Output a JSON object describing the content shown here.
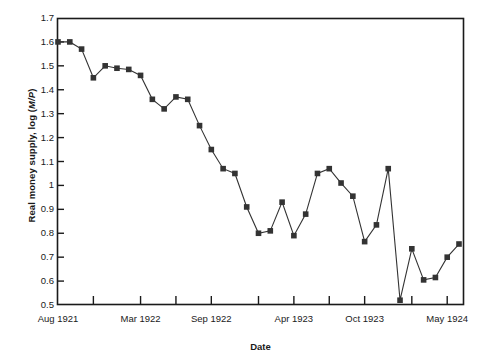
{
  "chart_data": {
    "type": "line",
    "title": "",
    "xlabel": "Date",
    "ylabel": "Real money supply, log (M/P)",
    "ylabel_plain": "Real money supply, log (",
    "ylabel_italic": "M/P",
    "ylabel_tail": ")",
    "ylim": [
      0.5,
      1.7
    ],
    "yticks": [
      0.5,
      0.6,
      0.7,
      0.8,
      0.9,
      1.0,
      1.1,
      1.2,
      1.3,
      1.4,
      1.5,
      1.6,
      1.7
    ],
    "ytick_labels": [
      "0.5",
      "0.6",
      "0.7",
      "0.8",
      "0.9",
      "1",
      "1.1",
      "1.2",
      "1.3",
      "1.4",
      "1.5",
      "1.6",
      "1.7"
    ],
    "xtick_labels": [
      "Aug 1921",
      "Mar 1922",
      "Sep 1922",
      "Apr 1923",
      "Oct 1923",
      "May 1924"
    ],
    "xtick_indices": [
      0,
      7,
      13,
      20,
      26,
      33
    ],
    "minor_xtick_indices": [
      3,
      10,
      17,
      23,
      30
    ],
    "grid": false,
    "legend": false,
    "marker": "square",
    "marker_color": "#333333",
    "line_color": "#333333",
    "x": [
      "Aug 1921",
      "Sep 1921",
      "Oct 1921",
      "Nov 1921",
      "Dec 1921",
      "Jan 1922",
      "Feb 1922",
      "Mar 1922",
      "Apr 1922",
      "May 1922",
      "Jun 1922",
      "Jul 1922",
      "Aug 1922",
      "Sep 1922",
      "Oct 1922",
      "Nov 1922",
      "Dec 1922",
      "Jan 1923",
      "Feb 1923",
      "Mar 1923",
      "Apr 1923",
      "May 1923",
      "Jun 1923",
      "Jul 1923",
      "Aug 1923",
      "Sep 1923",
      "Oct 1923",
      "Nov 1923",
      "Dec 1923",
      "Jan 1924",
      "Feb 1924",
      "Mar 1924",
      "Apr 1924",
      "May 1924",
      "Jun 1924"
    ],
    "values": [
      1.6,
      1.6,
      1.57,
      1.45,
      1.5,
      1.49,
      1.485,
      1.46,
      1.36,
      1.32,
      1.37,
      1.36,
      1.25,
      1.15,
      1.07,
      1.05,
      0.91,
      0.8,
      0.81,
      0.93,
      0.79,
      0.88,
      1.05,
      1.07,
      1.01,
      0.955,
      0.765,
      0.835,
      1.07,
      0.52,
      0.735,
      0.605,
      0.615,
      0.7,
      0.755
    ],
    "categories_note": "Monthly observations, Aug 1921 through Jun 1924"
  },
  "axes": {
    "plot_left": 57,
    "plot_right": 464,
    "plot_top": 18,
    "plot_bottom": 305
  }
}
